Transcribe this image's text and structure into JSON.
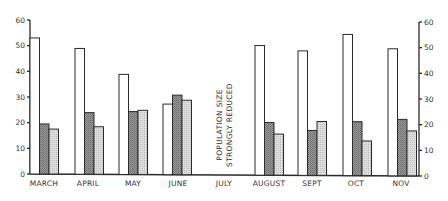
{
  "chart_data": {
    "type": "bar",
    "title": "",
    "xlabel": "",
    "ylabel": "",
    "ylim": [
      0,
      60
    ],
    "yticks": [
      0,
      10,
      20,
      30,
      40,
      50,
      60
    ],
    "grid": false,
    "legend": null,
    "dual_y_axis": true,
    "categories": [
      "MARCH",
      "APRIL",
      "MAY",
      "JUNE",
      "JULY",
      "AUGUST",
      "SEPT",
      "OCT",
      "NOV"
    ],
    "series": [
      {
        "name": "series-1 (white)",
        "color": "#ffffff",
        "values": [
          53,
          49,
          39,
          27.5,
          null,
          50.5,
          48.5,
          55,
          49.5
        ]
      },
      {
        "name": "series-2 (dark stipple)",
        "color": "#8a8a8a",
        "values": [
          19.5,
          24,
          24.5,
          31,
          null,
          20.5,
          17.5,
          21,
          22
        ]
      },
      {
        "name": "series-3 (light stipple)",
        "color": "#cfcfcf",
        "values": [
          17.5,
          18.5,
          25,
          29,
          null,
          16,
          21,
          13.5,
          17.5
        ]
      }
    ],
    "annotations": [
      {
        "category": "JULY",
        "lines": [
          "POPULATION SIZE",
          "STRONGLY REDUCED"
        ],
        "orientation": "vertical"
      }
    ]
  }
}
